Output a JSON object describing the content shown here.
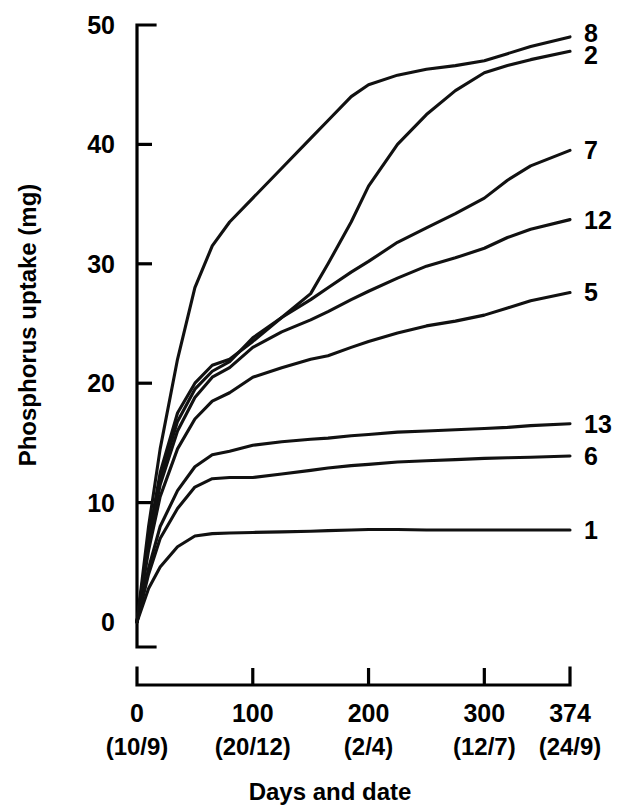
{
  "chart_data": {
    "type": "line",
    "title": "",
    "xlabel": "Days and date",
    "ylabel": "Phosphorus uptake (mg)",
    "xlim": [
      0,
      374
    ],
    "ylim": [
      0,
      50
    ],
    "grid": false,
    "legend_position": "right-of-plot-end-labels",
    "x_ticks": [
      0,
      100,
      200,
      300,
      374
    ],
    "x_tick_labels": [
      "0",
      "100",
      "200",
      "300",
      "374"
    ],
    "x_tick_sublabels": [
      "(10/9)",
      "(20/12)",
      "(2/4)",
      "(12/7)",
      "(24/9)"
    ],
    "y_ticks": [
      0,
      10,
      20,
      30,
      40,
      50
    ],
    "y_tick_labels": [
      "0",
      "10",
      "20",
      "30",
      "40",
      "50"
    ],
    "x": [
      0,
      10,
      20,
      35,
      50,
      65,
      80,
      100,
      125,
      150,
      165,
      185,
      200,
      225,
      250,
      275,
      300,
      320,
      340,
      374
    ],
    "series": [
      {
        "name": "8",
        "label": "8",
        "values": [
          0,
          8.0,
          14.5,
          22.0,
          28.0,
          31.5,
          33.5,
          35.5,
          38.0,
          40.5,
          42.0,
          44.0,
          45.0,
          45.8,
          46.3,
          46.6,
          47.0,
          47.6,
          48.2,
          49.0
        ]
      },
      {
        "name": "2",
        "label": "2",
        "values": [
          0,
          7.0,
          12.5,
          17.5,
          20.0,
          21.5,
          22.0,
          23.5,
          25.5,
          27.5,
          30.0,
          33.5,
          36.5,
          40.0,
          42.5,
          44.5,
          46.0,
          46.6,
          47.1,
          47.8
        ]
      },
      {
        "name": "7",
        "label": "7",
        "values": [
          0,
          6.8,
          12.0,
          16.8,
          19.5,
          21.0,
          21.8,
          23.8,
          25.5,
          27.0,
          28.0,
          29.3,
          30.2,
          31.8,
          33.0,
          34.2,
          35.5,
          37.0,
          38.2,
          39.5
        ]
      },
      {
        "name": "12",
        "label": "12",
        "values": [
          0,
          6.5,
          11.5,
          16.0,
          18.8,
          20.5,
          21.3,
          23.0,
          24.3,
          25.3,
          26.0,
          27.0,
          27.7,
          28.8,
          29.8,
          30.5,
          31.3,
          32.2,
          32.9,
          33.7
        ]
      },
      {
        "name": "5",
        "label": "5",
        "values": [
          0,
          6.0,
          10.5,
          14.5,
          17.0,
          18.5,
          19.2,
          20.5,
          21.3,
          22.0,
          22.3,
          23.0,
          23.5,
          24.2,
          24.8,
          25.2,
          25.7,
          26.3,
          26.9,
          27.6
        ]
      },
      {
        "name": "13",
        "label": "13",
        "values": [
          0,
          4.5,
          8.0,
          11.0,
          13.0,
          14.0,
          14.3,
          14.8,
          15.1,
          15.3,
          15.4,
          15.6,
          15.7,
          15.9,
          16.0,
          16.1,
          16.2,
          16.3,
          16.45,
          16.6
        ]
      },
      {
        "name": "6",
        "label": "6",
        "values": [
          0,
          4.0,
          7.0,
          9.5,
          11.3,
          12.0,
          12.1,
          12.1,
          12.4,
          12.7,
          12.9,
          13.1,
          13.2,
          13.4,
          13.5,
          13.6,
          13.7,
          13.75,
          13.8,
          13.9
        ]
      },
      {
        "name": "1",
        "label": "1",
        "values": [
          0,
          2.8,
          4.6,
          6.3,
          7.2,
          7.4,
          7.45,
          7.5,
          7.55,
          7.6,
          7.65,
          7.7,
          7.75,
          7.75,
          7.7,
          7.7,
          7.7,
          7.7,
          7.7,
          7.7
        ]
      }
    ]
  },
  "colors": {
    "ink": "#000000",
    "background": "#ffffff"
  }
}
